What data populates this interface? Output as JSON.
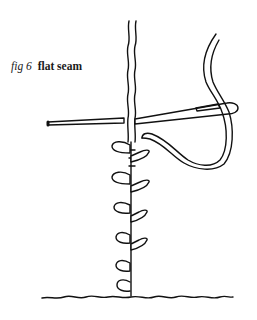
{
  "caption": {
    "figure_label": "fig 6",
    "title": "flat seam"
  },
  "illustration": {
    "subject": "flat seam stitch diagram",
    "elements": [
      "seam-edges",
      "needle",
      "thread",
      "stitches",
      "base-line"
    ],
    "stitch_count": 8,
    "ink_color": "#111111",
    "background": "#ffffff"
  }
}
